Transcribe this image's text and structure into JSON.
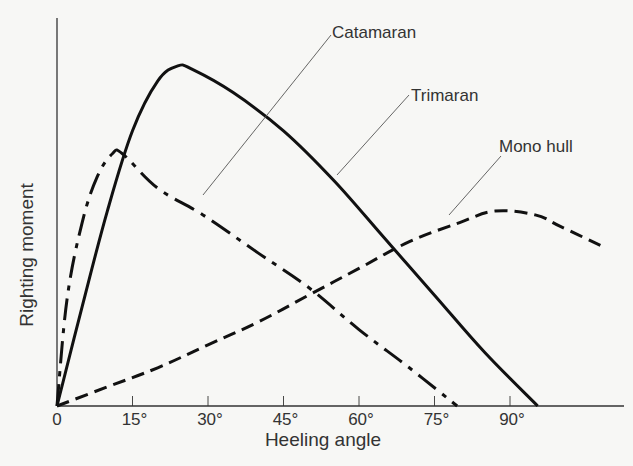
{
  "chart_data": {
    "type": "line",
    "title": "",
    "xlabel": "Heeling angle",
    "ylabel": "Righting moment",
    "x_ticks": [
      "0",
      "15°",
      "30°",
      "45°",
      "60°",
      "75°",
      "90°"
    ],
    "x_tick_values": [
      0,
      15,
      30,
      45,
      60,
      75,
      90
    ],
    "xlim": [
      0,
      108
    ],
    "ylim": [
      0,
      100
    ],
    "y_ticks": [],
    "grid": false,
    "legend": "inline leader-line labels",
    "series": [
      {
        "name": "Catamaran",
        "style": "dash-dot",
        "x": [
          0,
          2,
          5,
          8,
          11,
          13,
          20,
          29,
          40,
          50,
          60,
          70,
          79.5
        ],
        "y": [
          0,
          28,
          48,
          60,
          66,
          66,
          57,
          50,
          40,
          31,
          20,
          10,
          0
        ]
      },
      {
        "name": "Trimaran",
        "style": "solid",
        "x": [
          0,
          5,
          10,
          15,
          20,
          24,
          27,
          35,
          45,
          55,
          65,
          75,
          85,
          95.5
        ],
        "y": [
          0,
          26,
          51,
          72,
          85,
          89,
          88,
          82,
          72,
          59,
          44,
          29,
          14,
          0
        ]
      },
      {
        "name": "Mono hull",
        "style": "dashed",
        "x": [
          0,
          10,
          20,
          30,
          40,
          50,
          60,
          70,
          80,
          87,
          95,
          100,
          108
        ],
        "y": [
          0,
          5,
          10,
          16,
          22,
          29,
          36,
          43,
          48,
          51,
          50,
          47,
          42
        ]
      }
    ],
    "annotations": [
      {
        "text": "Catamaran",
        "points_to": "Catamaran"
      },
      {
        "text": "Trimaran",
        "points_to": "Trimaran"
      },
      {
        "text": "Mono hull",
        "points_to": "Mono hull"
      }
    ]
  }
}
